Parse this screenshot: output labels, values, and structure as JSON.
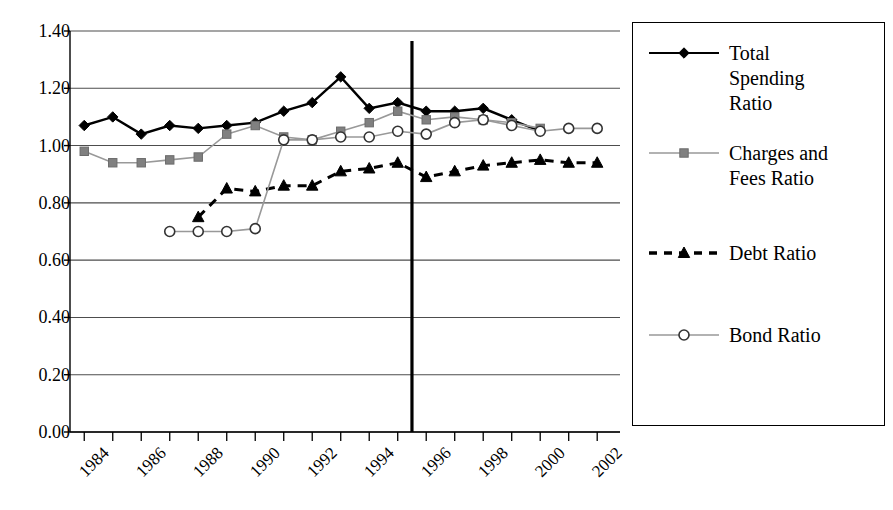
{
  "chart_data": {
    "type": "line",
    "title": "",
    "xlabel": "",
    "ylabel": "",
    "xlim": [
      1983.5,
      2002.8
    ],
    "ylim": [
      0.0,
      1.4
    ],
    "grid": true,
    "legend_position": "right",
    "y_ticks": [
      "1.40",
      "1.20",
      "1.00",
      "0.80",
      "0.60",
      "0.40",
      "0.20",
      "0.00"
    ],
    "y_tick_values": [
      1.4,
      1.2,
      1.0,
      0.8,
      0.6,
      0.4,
      0.2,
      0.0
    ],
    "x_ticks": [
      "1984",
      "1986",
      "1988",
      "1990",
      "1992",
      "1994",
      "1996",
      "1998",
      "2000",
      "2002"
    ],
    "x_tick_values": [
      1984,
      1986,
      1988,
      1990,
      1992,
      1994,
      1996,
      1998,
      2000,
      2002
    ],
    "x_minor_tick_values": [
      1984,
      1985,
      1986,
      1987,
      1988,
      1989,
      1990,
      1991,
      1992,
      1993,
      1994,
      1995,
      1996,
      1997,
      1998,
      1999,
      2000,
      2001,
      2002
    ],
    "annotations": [
      {
        "name": "vertical-reference-line",
        "type": "vline",
        "x": 1995.5,
        "color": "#000000",
        "width": 3.2
      }
    ],
    "series": [
      {
        "name": "Total Spending Ratio",
        "label": "Total\nSpending\nRatio",
        "marker": "diamond",
        "line_style": "solid",
        "color": "#000000",
        "marker_color": "#000000",
        "x": [
          1984,
          1985,
          1986,
          1987,
          1988,
          1989,
          1990,
          1991,
          1992,
          1993,
          1994,
          1995,
          1996,
          1997,
          1998,
          1999,
          2000
        ],
        "values": [
          1.07,
          1.1,
          1.04,
          1.07,
          1.06,
          1.07,
          1.08,
          1.12,
          1.15,
          1.24,
          1.13,
          1.15,
          1.12,
          1.12,
          1.13,
          1.09,
          1.05
        ]
      },
      {
        "name": "Charges and Fees Ratio",
        "label": "Charges and\nFees Ratio",
        "marker": "square",
        "line_style": "solid",
        "color": "#999999",
        "marker_color": "#808080",
        "x": [
          1984,
          1985,
          1986,
          1987,
          1988,
          1989,
          1990,
          1991,
          1992,
          1993,
          1994,
          1995,
          1996,
          1997,
          1998,
          1999,
          2000
        ],
        "values": [
          0.98,
          0.94,
          0.94,
          0.95,
          0.96,
          1.04,
          1.07,
          1.03,
          1.02,
          1.05,
          1.08,
          1.12,
          1.09,
          1.1,
          1.09,
          1.08,
          1.06
        ]
      },
      {
        "name": "Debt Ratio",
        "label": "Debt Ratio",
        "marker": "triangle",
        "line_style": "dashed",
        "color": "#000000",
        "marker_color": "#000000",
        "x": [
          1988,
          1989,
          1990,
          1991,
          1992,
          1993,
          1994,
          1995,
          1996,
          1997,
          1998,
          1999,
          2000,
          2001,
          2002
        ],
        "values": [
          0.75,
          0.85,
          0.84,
          0.86,
          0.86,
          0.91,
          0.92,
          0.94,
          0.89,
          0.91,
          0.93,
          0.94,
          0.95,
          0.94,
          0.94
        ]
      },
      {
        "name": "Bond Ratio",
        "label": "Bond Ratio",
        "marker": "circle-open",
        "line_style": "solid",
        "color": "#999999",
        "marker_color": "#ffffff",
        "x": [
          1987,
          1988,
          1989,
          1990,
          1991,
          1992,
          1993,
          1994,
          1995,
          1996,
          1997,
          1998,
          1999,
          2000,
          2001,
          2002
        ],
        "values": [
          0.7,
          0.7,
          0.7,
          0.71,
          1.02,
          1.02,
          1.03,
          1.03,
          1.05,
          1.04,
          1.08,
          1.09,
          1.07,
          1.05,
          1.06,
          1.06
        ]
      }
    ]
  },
  "legend": {
    "entries": [
      {
        "label": "Total\nSpending\nRatio",
        "marker": "diamond",
        "style": "solid",
        "color": "#000000"
      },
      {
        "label": "Charges and\nFees Ratio",
        "marker": "square",
        "style": "solid",
        "color": "#999999"
      },
      {
        "label": "Debt Ratio",
        "marker": "triangle",
        "style": "dashed",
        "color": "#000000"
      },
      {
        "label": "Bond Ratio",
        "marker": "circle-open",
        "style": "solid",
        "color": "#999999"
      }
    ]
  },
  "colors": {
    "axis": "#000000",
    "grid": "#4d4d4d",
    "series_dark": "#000000",
    "series_gray": "#999999",
    "background": "#ffffff"
  }
}
